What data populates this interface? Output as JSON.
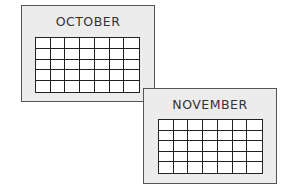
{
  "calendars": [
    {
      "month": "OCTOBER",
      "rows": 5,
      "cols": 7
    },
    {
      "month": "NOVEMBER",
      "rows": 5,
      "cols": 7
    }
  ],
  "colors": {
    "card_fill": "#ececec",
    "border": "#555555",
    "grid_line": "#222222"
  }
}
